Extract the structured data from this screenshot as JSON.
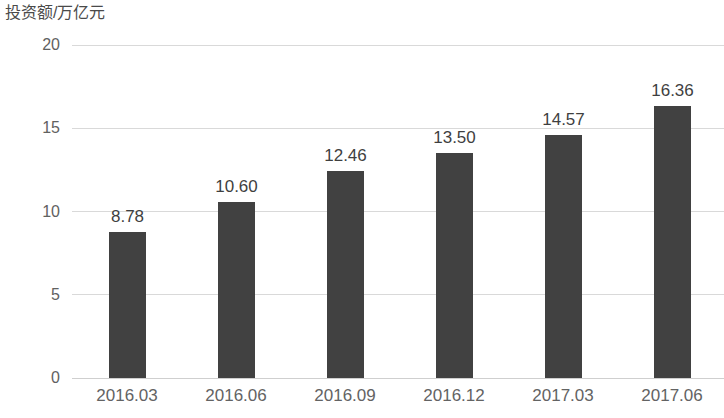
{
  "chart_data": {
    "type": "bar",
    "title": "",
    "ylabel": "投资额/万亿元",
    "xlabel": "",
    "categories": [
      "2016.03",
      "2016.06",
      "2016.09",
      "2016.12",
      "2017.03",
      "2017.06"
    ],
    "values": [
      8.78,
      10.6,
      12.46,
      13.5,
      14.57,
      16.36
    ],
    "value_labels": [
      "8.78",
      "10.60",
      "12.46",
      "13.50",
      "14.57",
      "16.36"
    ],
    "ylim": [
      0,
      20
    ],
    "yticks": [
      0,
      5,
      10,
      15,
      20
    ],
    "ytick_labels": [
      "0",
      "5",
      "10",
      "15",
      "20"
    ],
    "grid": true,
    "grid_axis": "y",
    "legend": false,
    "legend_position": "none",
    "series": [
      {
        "name": "投资额",
        "values": [
          8.78,
          10.6,
          12.46,
          13.5,
          14.57,
          16.36
        ],
        "color": "#414141"
      }
    ],
    "colors": {
      "bar": "#414141",
      "gridline": "#d9d9d9",
      "baseline": "#cfcfcf",
      "value_label": "#3f3f3f",
      "tick_label": "#636363",
      "axis_title": "#4a4a4a",
      "background": "#ffffff"
    }
  }
}
